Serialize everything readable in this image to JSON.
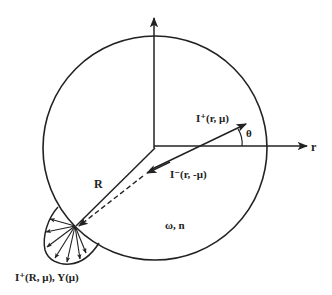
{
  "diagram": {
    "type": "radiative-transfer-sphere",
    "colors": {
      "ink": "#222222",
      "background": "#ffffff"
    },
    "labels": {
      "r_axis": "r",
      "theta": "θ",
      "outgoing_intensity": "I⁺(r, μ)",
      "incoming_intensity": "I⁻(r, -μ)",
      "radius": "R",
      "medium_properties": "ω, n",
      "boundary_emission": "I⁺(R, μ), Y(μ)"
    }
  }
}
